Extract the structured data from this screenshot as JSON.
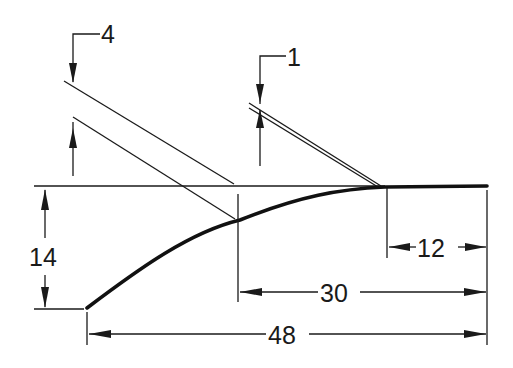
{
  "diagram": {
    "type": "transition curve dimension drawing",
    "callouts": [
      {
        "id": "callout-4",
        "label": "4",
        "description": "offset between upper parallel lines"
      },
      {
        "id": "callout-1",
        "label": "1",
        "description": "offset between tangent double line"
      }
    ],
    "dimensions": {
      "vertical": {
        "label": "14"
      },
      "horizontal_short": {
        "label": "12"
      },
      "horizontal_mid": {
        "label": "30"
      },
      "horizontal_long": {
        "label": "48"
      }
    },
    "colors": {
      "line": "#1a1a1a",
      "background": "#ffffff"
    }
  }
}
